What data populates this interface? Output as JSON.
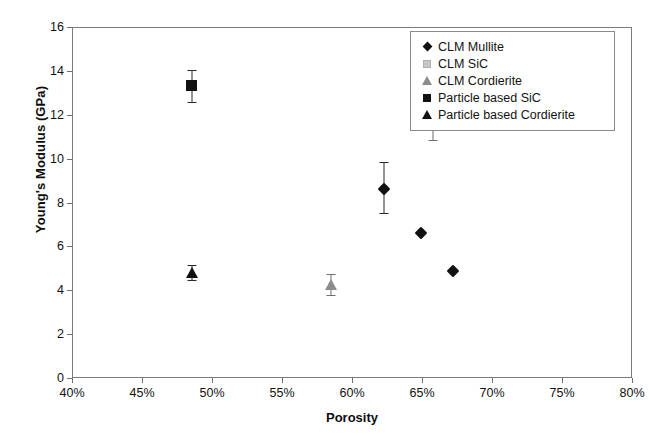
{
  "chart_data": {
    "type": "scatter",
    "title": "",
    "xlabel": "Porosity",
    "ylabel": "Young's Modulus (GPa)",
    "xlim": [
      40,
      80
    ],
    "ylim": [
      0,
      16
    ],
    "xtick_step": 5,
    "ytick_step": 2,
    "xticks": [
      "40%",
      "45%",
      "50%",
      "55%",
      "60%",
      "65%",
      "70%",
      "75%",
      "80%"
    ],
    "yticks": [
      "0",
      "2",
      "4",
      "6",
      "8",
      "10",
      "12",
      "14",
      "16"
    ],
    "grid": false,
    "legend_position": "top-right",
    "series": [
      {
        "name": "CLM Mullite",
        "marker": "diamond",
        "color": "#111111",
        "points": [
          {
            "x": 62.3,
            "y": 8.6,
            "yerr_low": 7.5,
            "yerr_high": 9.85
          },
          {
            "x": 64.9,
            "y": 6.6
          },
          {
            "x": 67.2,
            "y": 4.9
          }
        ]
      },
      {
        "name": "CLM SiC",
        "marker": "square",
        "color": "#b9b9b9",
        "points": [
          {
            "x": 65.8,
            "y": 12.2,
            "yerr_low": 10.85,
            "yerr_high": 13.6
          }
        ]
      },
      {
        "name": "CLM Cordierite",
        "marker": "triangle",
        "color": "#8c8c8c",
        "points": [
          {
            "x": 58.5,
            "y": 4.25,
            "yerr_low": 3.8,
            "yerr_high": 4.75
          }
        ]
      },
      {
        "name": "Particle based SiC",
        "marker": "square",
        "color": "#111111",
        "points": [
          {
            "x": 48.6,
            "y": 13.3,
            "yerr_low": 12.6,
            "yerr_high": 14.05
          }
        ]
      },
      {
        "name": "Particle based Cordierite",
        "marker": "triangle",
        "color": "#111111",
        "points": [
          {
            "x": 48.6,
            "y": 4.8,
            "yerr_low": 4.45,
            "yerr_high": 5.15
          }
        ]
      }
    ]
  }
}
